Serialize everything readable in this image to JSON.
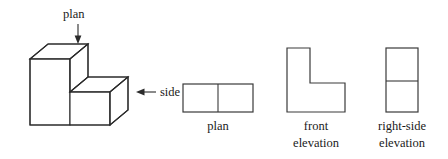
{
  "figure": {
    "type": "orthographic-projection-diagram",
    "background_color": "#ffffff",
    "line_color": "#2b2b2b",
    "solid": {
      "name": "stepped-block",
      "description": "Isometric view of an L-shaped stepped rectangular solid",
      "viewing_labels": {
        "plan": "plan",
        "side": "side"
      }
    },
    "views": [
      {
        "id": "plan",
        "caption_line1": "plan",
        "caption_line2": "",
        "shape": "rectangle-split-vertically",
        "divisions": 2
      },
      {
        "id": "front-elevation",
        "caption_line1": "front",
        "caption_line2": "elevation",
        "shape": "L-shape",
        "divisions": 0
      },
      {
        "id": "right-side-elevation",
        "caption_line1": "right-side",
        "caption_line2": "elevation",
        "shape": "rectangle-split-horizontally",
        "divisions": 2
      }
    ]
  }
}
